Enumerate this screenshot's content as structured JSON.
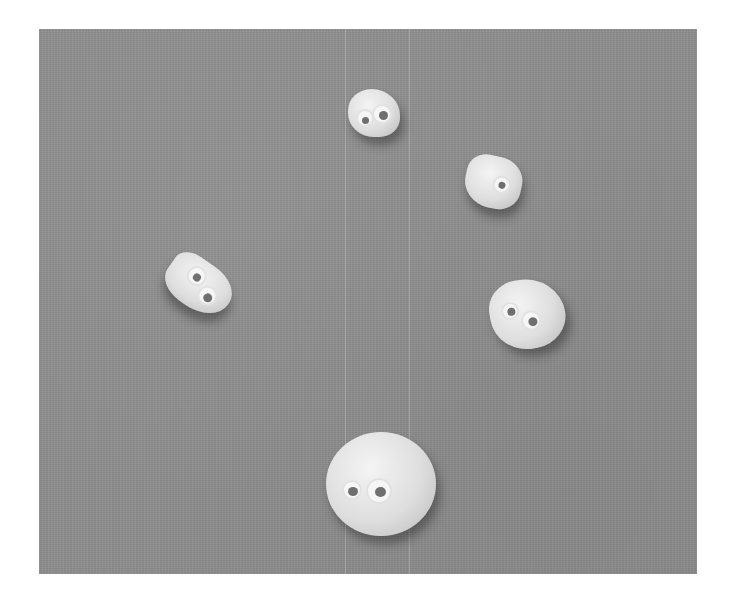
{
  "image": {
    "description": "Photograph of five small pebbles with googly eyes arranged in an arc on a gray surface",
    "background_color": "#8e8e8e",
    "border_color": "#ffffff",
    "stones": [
      {
        "id": "top-center",
        "eyes": 2
      },
      {
        "id": "upper-right",
        "eyes": 1
      },
      {
        "id": "left",
        "eyes": 2
      },
      {
        "id": "right",
        "eyes": 2
      },
      {
        "id": "bottom-large",
        "eyes": 2
      }
    ]
  }
}
